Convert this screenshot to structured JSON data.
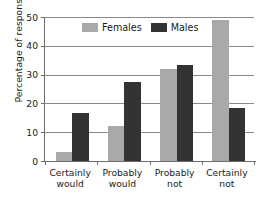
{
  "chart_data": {
    "type": "bar",
    "title": "",
    "subtitle": "",
    "xlabel": "",
    "ylabel": "Percentage of responses",
    "categories": [
      "Certainly would",
      "Probably would",
      "Probably not",
      "Certainly not"
    ],
    "category_lines": [
      [
        "Certainly",
        "would"
      ],
      [
        "Probably",
        "would"
      ],
      [
        "Probably",
        "not"
      ],
      [
        "Certainly",
        "not"
      ]
    ],
    "series": [
      {
        "name": "Females",
        "color": "#a9a9a9",
        "values": [
          3,
          12,
          32,
          49
        ]
      },
      {
        "name": "Males",
        "color": "#333333",
        "values": [
          16.5,
          27.5,
          33.5,
          18.5
        ]
      }
    ],
    "ylim": [
      0,
      50
    ],
    "yticks": [
      0,
      10,
      20,
      30,
      40,
      50
    ],
    "ytick_labels": [
      "0",
      "10",
      "20",
      "30",
      "40",
      "50"
    ],
    "grid": "horizontal",
    "legend_position": "top-center"
  },
  "legend": {
    "entries": [
      {
        "label": "Females",
        "swatch": "females-swatch"
      },
      {
        "label": "Males",
        "swatch": "males-swatch"
      }
    ]
  },
  "colors": {
    "females": "#a9a9a9",
    "males": "#333333",
    "axis": "#6d6d6d",
    "grid": "#8a8a8a",
    "text": "#1a1a1a",
    "background": "#ffffff"
  }
}
